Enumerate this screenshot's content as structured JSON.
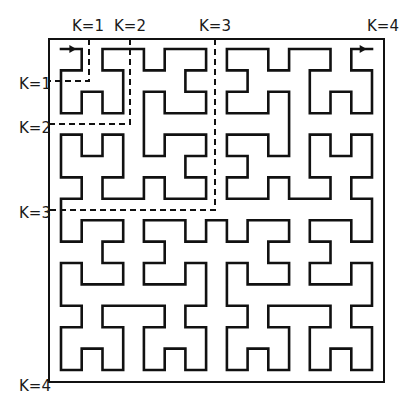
{
  "diagram": {
    "type": "hilbert-curve",
    "order": 4,
    "grid_size": 16,
    "colors": {
      "curve": "#111111",
      "frame": "#111111",
      "dashed": "#111111",
      "background": "#ffffff"
    },
    "frame": {
      "x0": 49,
      "y0": 39,
      "x1": 384,
      "y1": 382
    },
    "grid": {
      "x0": 61,
      "y0": 49,
      "x1": 372,
      "y1": 370
    },
    "start_arrow": {
      "from_col": 0,
      "to_col": 1,
      "row": 0,
      "direction": "right"
    },
    "end_arrow": {
      "from_col": 14,
      "to_col": 15,
      "row": 0,
      "direction": "right"
    },
    "subdivisions": [
      {
        "level": 1,
        "x": 89,
        "y": 81
      },
      {
        "level": 2,
        "x": 130,
        "y": 124
      },
      {
        "level": 3,
        "x": 215,
        "y": 210
      }
    ],
    "labels": {
      "top": [
        {
          "text": "K=1",
          "x": 88,
          "y": 31
        },
        {
          "text": "K=2",
          "x": 130,
          "y": 31
        },
        {
          "text": "K=3",
          "x": 215,
          "y": 31
        },
        {
          "text": "K=4",
          "x": 383,
          "y": 31
        }
      ],
      "left": [
        {
          "text": "K=1",
          "x": 35,
          "y": 89
        },
        {
          "text": "K=2",
          "x": 35,
          "y": 133
        },
        {
          "text": "K=3",
          "x": 35,
          "y": 218
        },
        {
          "text": "K=4",
          "x": 35,
          "y": 391
        }
      ]
    }
  }
}
